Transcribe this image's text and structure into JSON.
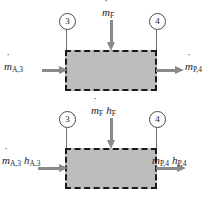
{
  "diagram": {
    "panels": [
      {
        "id": "mass-balance",
        "stations": [
          {
            "name": "station-3",
            "label": "3"
          },
          {
            "name": "station-4",
            "label": "4"
          }
        ],
        "inlet": {
          "symbol": "m",
          "sub": "A,3",
          "dot": true
        },
        "outlet": {
          "symbol": "m",
          "sub": "P,4",
          "dot": true
        },
        "fuel": {
          "symbol": "m",
          "sub": "F",
          "dot": true
        },
        "arrows": {
          "inlet_direction": "right",
          "outlet_direction": "right",
          "fuel_direction": "down"
        }
      },
      {
        "id": "energy-balance",
        "stations": [
          {
            "name": "station-3",
            "label": "3"
          },
          {
            "name": "station-4",
            "label": "4"
          }
        ],
        "inlet": [
          {
            "symbol": "m",
            "sub": "A,3",
            "dot": true
          },
          {
            "symbol": "h",
            "sub": "A,3",
            "dot": false
          }
        ],
        "outlet": [
          {
            "symbol": "m",
            "sub": "P,4",
            "dot": true
          },
          {
            "symbol": "h",
            "sub": "P,4",
            "dot": false
          }
        ],
        "fuel": [
          {
            "symbol": "m",
            "sub": "F",
            "dot": true
          },
          {
            "symbol": "h",
            "sub": "F",
            "dot": false
          }
        ],
        "arrows": {
          "inlet_direction": "right",
          "outlet_direction": "right",
          "fuel_direction": "down"
        }
      }
    ],
    "colors": {
      "control_volume_fill": "#bdbdbd",
      "control_volume_border": "#1a1a1a",
      "arrow": "#8a8a8a",
      "leader_line": "#6f6f6f",
      "background": "#ffffff"
    },
    "control_volume": {
      "border_style": "dashed",
      "name": "control-volume-boundary"
    }
  }
}
